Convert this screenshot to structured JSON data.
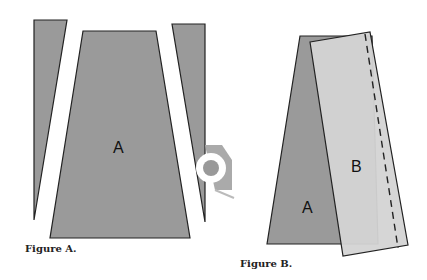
{
  "figures": [
    {
      "id": "A",
      "caption": "Figure A.",
      "pieces": [
        {
          "name": "left-wedge",
          "label": ""
        },
        {
          "name": "center-trapezoid",
          "label": "A"
        },
        {
          "name": "right-wedge",
          "label": ""
        }
      ],
      "icon": "measuring-tape-icon"
    },
    {
      "id": "B",
      "caption": "Figure B.",
      "pieces": [
        {
          "name": "piece-a",
          "label": "A"
        },
        {
          "name": "piece-b",
          "label": "B"
        }
      ],
      "seam": "dashed stitch line"
    }
  ],
  "colors": {
    "piece_a_fill": "#9a9a9a",
    "piece_b_fill": "#d4d4d4",
    "outline": "#222222",
    "background": "#ffffff"
  }
}
